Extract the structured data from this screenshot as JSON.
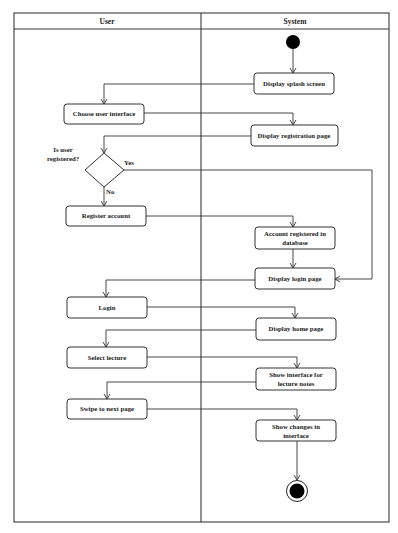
{
  "diagram": {
    "type": "UML activity diagram with swimlanes",
    "lanes": [
      {
        "id": "user",
        "title": "User"
      },
      {
        "id": "system",
        "title": "System"
      }
    ],
    "nodes": [
      {
        "id": "start",
        "kind": "initial",
        "lane": "system"
      },
      {
        "id": "splash",
        "kind": "action",
        "lane": "system",
        "lines": [
          "Display splash screen"
        ]
      },
      {
        "id": "choose_ui",
        "kind": "action",
        "lane": "user",
        "lines": [
          "Choose user interface"
        ]
      },
      {
        "id": "reg_page",
        "kind": "action",
        "lane": "system",
        "lines": [
          "Display registration page"
        ]
      },
      {
        "id": "decision",
        "kind": "decision",
        "lane": "user",
        "lines": [
          "Is user",
          "registered?"
        ]
      },
      {
        "id": "register",
        "kind": "action",
        "lane": "user",
        "lines": [
          "Register account"
        ]
      },
      {
        "id": "acct_db",
        "kind": "action",
        "lane": "system",
        "lines": [
          "Account registered in",
          "database"
        ]
      },
      {
        "id": "login_page",
        "kind": "action",
        "lane": "system",
        "lines": [
          "Display login page"
        ]
      },
      {
        "id": "login",
        "kind": "action",
        "lane": "user",
        "lines": [
          "Login"
        ]
      },
      {
        "id": "home_page",
        "kind": "action",
        "lane": "system",
        "lines": [
          "Display home page"
        ]
      },
      {
        "id": "select_lecture",
        "kind": "action",
        "lane": "user",
        "lines": [
          "Select lecture"
        ]
      },
      {
        "id": "lecture_notes",
        "kind": "action",
        "lane": "system",
        "lines": [
          "Show interface for",
          "lecture notes"
        ]
      },
      {
        "id": "swipe",
        "kind": "action",
        "lane": "user",
        "lines": [
          "Swipe to next page"
        ]
      },
      {
        "id": "changes",
        "kind": "action",
        "lane": "system",
        "lines": [
          "Show changes in",
          "interface"
        ]
      },
      {
        "id": "end",
        "kind": "final",
        "lane": "system"
      }
    ],
    "edges": [
      {
        "from": "start",
        "to": "splash",
        "label": ""
      },
      {
        "from": "splash",
        "to": "choose_ui",
        "label": ""
      },
      {
        "from": "choose_ui",
        "to": "reg_page",
        "label": ""
      },
      {
        "from": "reg_page",
        "to": "decision",
        "label": ""
      },
      {
        "from": "decision",
        "to": "login_page",
        "label": "Yes"
      },
      {
        "from": "decision",
        "to": "register",
        "label": "No"
      },
      {
        "from": "register",
        "to": "acct_db",
        "label": ""
      },
      {
        "from": "acct_db",
        "to": "login_page",
        "label": ""
      },
      {
        "from": "login_page",
        "to": "login",
        "label": ""
      },
      {
        "from": "login",
        "to": "home_page",
        "label": ""
      },
      {
        "from": "home_page",
        "to": "select_lecture",
        "label": ""
      },
      {
        "from": "select_lecture",
        "to": "lecture_notes",
        "label": ""
      },
      {
        "from": "lecture_notes",
        "to": "swipe",
        "label": ""
      },
      {
        "from": "swipe",
        "to": "changes",
        "label": ""
      },
      {
        "from": "changes",
        "to": "end",
        "label": ""
      }
    ],
    "labels": {
      "decision_question_line1": "Is user",
      "decision_question_line2": "registered?",
      "yes": "Yes",
      "no": "No"
    }
  }
}
